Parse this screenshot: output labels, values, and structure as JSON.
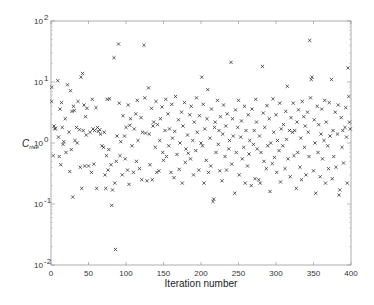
{
  "chart_data": {
    "type": "scatter",
    "title": "",
    "xlabel": "Iteration number",
    "ylabel": "C",
    "ylabel_subscript": "rise",
    "xlim": [
      0,
      400
    ],
    "ylim": [
      0.01,
      100
    ],
    "yscale": "log",
    "grid": false,
    "legend": null,
    "marker": "x",
    "marker_color": "#333333",
    "x_ticks": [
      0,
      50,
      100,
      150,
      200,
      250,
      300,
      350,
      400
    ],
    "x_tick_labels": [
      "0",
      "50",
      "100",
      "150",
      "200",
      "250",
      "300",
      "350",
      "400"
    ],
    "y_ticks": [
      0.01,
      0.1,
      1,
      10,
      100
    ],
    "y_tick_labels": [
      {
        "base": "10",
        "exp": "-2"
      },
      {
        "base": "10",
        "exp": "-1"
      },
      {
        "base": "10",
        "exp": "0"
      },
      {
        "base": "10",
        "exp": "1"
      },
      {
        "base": "10",
        "exp": "2"
      }
    ],
    "points": [
      [
        1,
        8.2
      ],
      [
        1,
        4.8
      ],
      [
        3,
        0.62
      ],
      [
        4,
        1.9
      ],
      [
        5,
        1.7
      ],
      [
        6,
        1.75
      ],
      [
        9,
        10.5
      ],
      [
        10,
        1.25
      ],
      [
        11,
        0.6
      ],
      [
        12,
        3.6
      ],
      [
        13,
        0.44
      ],
      [
        14,
        4.6
      ],
      [
        15,
        1.8
      ],
      [
        16,
        0.95
      ],
      [
        17,
        1.05
      ],
      [
        19,
        2.5
      ],
      [
        20,
        0.7
      ],
      [
        22,
        9.0
      ],
      [
        24,
        1.5
      ],
      [
        25,
        0.34
      ],
      [
        26,
        7.2
      ],
      [
        27,
        0.78
      ],
      [
        28,
        3.3
      ],
      [
        29,
        0.13
      ],
      [
        30,
        4.0
      ],
      [
        31,
        3.4
      ],
      [
        32,
        1.1
      ],
      [
        34,
        1.8
      ],
      [
        35,
        1.0
      ],
      [
        36,
        4.8
      ],
      [
        38,
        1.65
      ],
      [
        39,
        0.4
      ],
      [
        40,
        12.0
      ],
      [
        41,
        0.18
      ],
      [
        42,
        13.8
      ],
      [
        43,
        1.6
      ],
      [
        44,
        4.2
      ],
      [
        45,
        0.42
      ],
      [
        46,
        2.7
      ],
      [
        47,
        1.35
      ],
      [
        48,
        3.7
      ],
      [
        50,
        0.42
      ],
      [
        52,
        1.5
      ],
      [
        54,
        0.33
      ],
      [
        55,
        5.2
      ],
      [
        56,
        1.7
      ],
      [
        57,
        0.45
      ],
      [
        58,
        1.6
      ],
      [
        60,
        3.8
      ],
      [
        61,
        0.18
      ],
      [
        62,
        1.8
      ],
      [
        63,
        1.55
      ],
      [
        65,
        1.65
      ],
      [
        66,
        1.4
      ],
      [
        68,
        0.9
      ],
      [
        70,
        0.85
      ],
      [
        71,
        1.5
      ],
      [
        72,
        0.3
      ],
      [
        73,
        0.18
      ],
      [
        74,
        0.62
      ],
      [
        75,
        5.2
      ],
      [
        76,
        0.36
      ],
      [
        77,
        0.78
      ],
      [
        78,
        5.3
      ],
      [
        80,
        0.44
      ],
      [
        81,
        0.095
      ],
      [
        82,
        0.17
      ],
      [
        84,
        25.0
      ],
      [
        85,
        0.22
      ],
      [
        86,
        0.018
      ],
      [
        87,
        0.5
      ],
      [
        88,
        1.3
      ],
      [
        90,
        42.0
      ],
      [
        91,
        4.5
      ],
      [
        92,
        0.62
      ],
      [
        93,
        1.05
      ],
      [
        95,
        0.3
      ],
      [
        96,
        2.8
      ],
      [
        98,
        1.3
      ],
      [
        99,
        0.55
      ],
      [
        100,
        1.8
      ],
      [
        102,
        0.36
      ],
      [
        103,
        4.2
      ],
      [
        104,
        0.21
      ],
      [
        105,
        1.95
      ],
      [
        106,
        2.5
      ],
      [
        108,
        0.9
      ],
      [
        110,
        0.33
      ],
      [
        111,
        1.7
      ],
      [
        113,
        3.0
      ],
      [
        114,
        0.5
      ],
      [
        115,
        5.0
      ],
      [
        116,
        1.1
      ],
      [
        118,
        0.38
      ],
      [
        120,
        2.6
      ],
      [
        121,
        0.25
      ],
      [
        122,
        1.5
      ],
      [
        124,
        40.0
      ],
      [
        125,
        5.5
      ],
      [
        126,
        1.45
      ],
      [
        128,
        0.24
      ],
      [
        130,
        8.0
      ],
      [
        131,
        1.4
      ],
      [
        132,
        0.44
      ],
      [
        134,
        3.7
      ],
      [
        135,
        0.25
      ],
      [
        136,
        1.9
      ],
      [
        137,
        2.2
      ],
      [
        139,
        0.85
      ],
      [
        140,
        4.8
      ],
      [
        141,
        0.33
      ],
      [
        142,
        2.0
      ],
      [
        144,
        0.35
      ],
      [
        145,
        1.1
      ],
      [
        146,
        2.5
      ],
      [
        148,
        3.9
      ],
      [
        149,
        0.7
      ],
      [
        150,
        0.52
      ],
      [
        152,
        1.6
      ],
      [
        153,
        5.2
      ],
      [
        154,
        0.6
      ],
      [
        156,
        3.0
      ],
      [
        157,
        0.9
      ],
      [
        158,
        1.7
      ],
      [
        160,
        0.33
      ],
      [
        161,
        4.3
      ],
      [
        162,
        1.2
      ],
      [
        164,
        0.27
      ],
      [
        165,
        1.55
      ],
      [
        166,
        5.8
      ],
      [
        168,
        0.65
      ],
      [
        170,
        2.4
      ],
      [
        171,
        0.37
      ],
      [
        172,
        1.0
      ],
      [
        174,
        3.2
      ],
      [
        175,
        0.22
      ],
      [
        176,
        1.9
      ],
      [
        178,
        4.6
      ],
      [
        179,
        0.48
      ],
      [
        180,
        0.8
      ],
      [
        182,
        1.35
      ],
      [
        183,
        0.68
      ],
      [
        185,
        2.9
      ],
      [
        186,
        0.55
      ],
      [
        187,
        4.0
      ],
      [
        189,
        1.1
      ],
      [
        190,
        0.3
      ],
      [
        191,
        2.2
      ],
      [
        193,
        0.75
      ],
      [
        194,
        5.5
      ],
      [
        195,
        1.5
      ],
      [
        197,
        0.36
      ],
      [
        198,
        2.8
      ],
      [
        200,
        1.0
      ],
      [
        201,
        12.0
      ],
      [
        202,
        0.9
      ],
      [
        203,
        4.3
      ],
      [
        204,
        0.22
      ],
      [
        205,
        1.7
      ],
      [
        207,
        0.52
      ],
      [
        208,
        2.5
      ],
      [
        209,
        7.5
      ],
      [
        210,
        0.33
      ],
      [
        212,
        1.2
      ],
      [
        213,
        0.42
      ],
      [
        214,
        3.6
      ],
      [
        216,
        0.11
      ],
      [
        217,
        0.12
      ],
      [
        218,
        1.8
      ],
      [
        219,
        2.2
      ],
      [
        220,
        0.7
      ],
      [
        222,
        5.0
      ],
      [
        223,
        0.95
      ],
      [
        224,
        1.6
      ],
      [
        225,
        0.35
      ],
      [
        226,
        2.7
      ],
      [
        228,
        0.24
      ],
      [
        229,
        1.4
      ],
      [
        230,
        4.2
      ],
      [
        232,
        0.6
      ],
      [
        233,
        1.9
      ],
      [
        234,
        0.36
      ],
      [
        235,
        3.0
      ],
      [
        237,
        0.8
      ],
      [
        238,
        1.1
      ],
      [
        240,
        21.0
      ],
      [
        241,
        0.45
      ],
      [
        242,
        2.5
      ],
      [
        243,
        1.3
      ],
      [
        245,
        0.15
      ],
      [
        246,
        3.5
      ],
      [
        247,
        0.7
      ],
      [
        249,
        1.8
      ],
      [
        250,
        5.0
      ],
      [
        251,
        0.3
      ],
      [
        253,
        1.25
      ],
      [
        254,
        2.3
      ],
      [
        255,
        0.55
      ],
      [
        257,
        0.85
      ],
      [
        258,
        4.0
      ],
      [
        259,
        0.22
      ],
      [
        260,
        1.6
      ],
      [
        262,
        0.42
      ],
      [
        263,
        2.9
      ],
      [
        264,
        0.66
      ],
      [
        265,
        1.1
      ],
      [
        267,
        0.2
      ],
      [
        268,
        3.6
      ],
      [
        270,
        0.95
      ],
      [
        271,
        1.6
      ],
      [
        272,
        0.26
      ],
      [
        273,
        5.2
      ],
      [
        274,
        2.2
      ],
      [
        275,
        0.8
      ],
      [
        277,
        0.25
      ],
      [
        278,
        1.3
      ],
      [
        279,
        0.22
      ],
      [
        280,
        0.7
      ],
      [
        282,
        18.0
      ],
      [
        283,
        3.1
      ],
      [
        284,
        0.5
      ],
      [
        285,
        1.8
      ],
      [
        287,
        0.38
      ],
      [
        288,
        4.1
      ],
      [
        289,
        0.9
      ],
      [
        291,
        2.5
      ],
      [
        292,
        0.16
      ],
      [
        293,
        1.0
      ],
      [
        295,
        0.46
      ],
      [
        296,
        5.3
      ],
      [
        297,
        1.5
      ],
      [
        298,
        0.58
      ],
      [
        300,
        2.9
      ],
      [
        301,
        0.33
      ],
      [
        302,
        1.1
      ],
      [
        304,
        0.75
      ],
      [
        305,
        4.5
      ],
      [
        306,
        0.23
      ],
      [
        307,
        1.7
      ],
      [
        309,
        0.9
      ],
      [
        310,
        2.0
      ],
      [
        312,
        0.38
      ],
      [
        313,
        3.3
      ],
      [
        314,
        1.15
      ],
      [
        315,
        8.5
      ],
      [
        316,
        0.55
      ],
      [
        318,
        1.6
      ],
      [
        319,
        0.28
      ],
      [
        320,
        2.6
      ],
      [
        322,
        1.5
      ],
      [
        323,
        4.5
      ],
      [
        324,
        0.62
      ],
      [
        325,
        1.6
      ],
      [
        327,
        0.18
      ],
      [
        328,
        2.2
      ],
      [
        329,
        0.7
      ],
      [
        330,
        3.5
      ],
      [
        332,
        0.4
      ],
      [
        333,
        1.2
      ],
      [
        334,
        0.25
      ],
      [
        335,
        4.8
      ],
      [
        337,
        2.7
      ],
      [
        338,
        0.85
      ],
      [
        339,
        1.9
      ],
      [
        340,
        0.3
      ],
      [
        342,
        3.2
      ],
      [
        343,
        1.5
      ],
      [
        344,
        0.6
      ],
      [
        345,
        48.0
      ],
      [
        346,
        5.5
      ],
      [
        347,
        11.0
      ],
      [
        348,
        12.0
      ],
      [
        350,
        0.35
      ],
      [
        351,
        2.4
      ],
      [
        352,
        1.0
      ],
      [
        353,
        0.15
      ],
      [
        355,
        4.0
      ],
      [
        356,
        0.7
      ],
      [
        357,
        2.0
      ],
      [
        359,
        0.28
      ],
      [
        360,
        1.4
      ],
      [
        361,
        3.6
      ],
      [
        362,
        0.55
      ],
      [
        364,
        1.1
      ],
      [
        365,
        5.0
      ],
      [
        366,
        0.22
      ],
      [
        367,
        2.2
      ],
      [
        369,
        0.9
      ],
      [
        370,
        0.38
      ],
      [
        371,
        4.6
      ],
      [
        372,
        1.3
      ],
      [
        374,
        11.0
      ],
      [
        375,
        0.26
      ],
      [
        376,
        1.6
      ],
      [
        377,
        0.6
      ],
      [
        379,
        3.2
      ],
      [
        380,
        0.4
      ],
      [
        382,
        1.4
      ],
      [
        383,
        4.2
      ],
      [
        384,
        0.14
      ],
      [
        385,
        0.17
      ],
      [
        387,
        2.6
      ],
      [
        388,
        0.85
      ],
      [
        389,
        1.6
      ],
      [
        390,
        0.47
      ],
      [
        392,
        1.8
      ],
      [
        393,
        3.8
      ],
      [
        394,
        1.25
      ],
      [
        395,
        0.22
      ],
      [
        396,
        17.0
      ],
      [
        397,
        5.8
      ],
      [
        398,
        2.2
      ],
      [
        399,
        1.7
      ]
    ]
  }
}
